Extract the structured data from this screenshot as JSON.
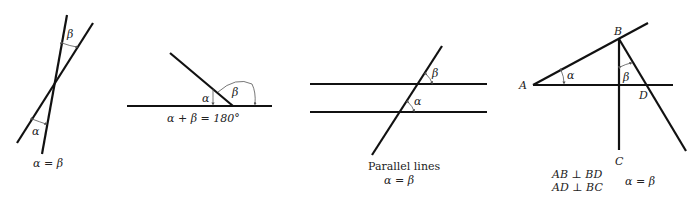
{
  "figures": [
    {
      "id": "vertical-angles",
      "labels": {
        "alpha": "α",
        "beta": "β"
      },
      "caption": "α = β"
    },
    {
      "id": "supplementary-angles",
      "labels": {
        "alpha": "α",
        "beta": "β"
      },
      "caption": "α + β = 180°"
    },
    {
      "id": "parallel-lines",
      "labels": {
        "alpha": "α",
        "beta": "β"
      },
      "caption_line1": "Parallel lines",
      "caption_line2": "α = β"
    },
    {
      "id": "perpendicular-sides",
      "labels": {
        "alpha": "α",
        "beta": "β",
        "A": "A",
        "B": "B",
        "C": "C",
        "D": "D"
      },
      "caption_line1": "AB ⊥ BD",
      "caption_line2": "AD ⊥ BC",
      "caption_right": "α = β"
    }
  ]
}
